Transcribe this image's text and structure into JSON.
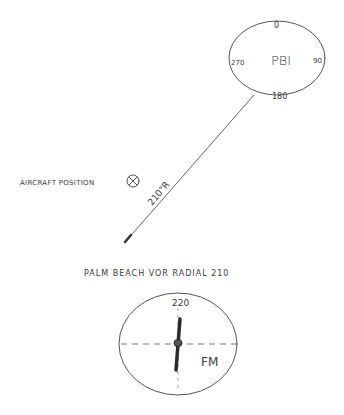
{
  "vor_station": {
    "identifier": "PBI",
    "compass_labels": {
      "north": "0",
      "east": "90",
      "south": "180",
      "west": "270"
    }
  },
  "radial_label": "210°R",
  "aircraft": {
    "label": "AIRCRAFT POSITION"
  },
  "caption": "PALM BEACH VOR RADIAL 210",
  "indicator": {
    "course": "220",
    "flag": "FM"
  },
  "colors": {
    "ink": "#3a3a3a",
    "needle": "#2b2b2b"
  }
}
